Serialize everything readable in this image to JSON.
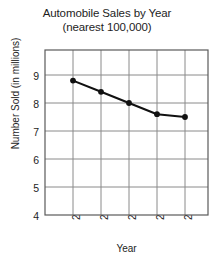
{
  "chart_data": {
    "type": "line",
    "title": "Automobile Sales by Year",
    "subtitle": "(nearest 100,000)",
    "xlabel": "Year",
    "ylabel": "Number Sold (in millions)",
    "categories": [
      "2006",
      "2007",
      "2008",
      "2009",
      "2010"
    ],
    "values": [
      8.8,
      8.4,
      8.0,
      7.6,
      7.5
    ],
    "series": [
      {
        "name": "Automobile Sales",
        "values": [
          8.8,
          8.4,
          8.0,
          7.6,
          7.5
        ]
      }
    ],
    "ylim": [
      4,
      9.9
    ],
    "yticks": [
      "9",
      "8",
      "7",
      "6",
      "5",
      "4"
    ],
    "ytick_values": [
      9,
      8,
      7,
      6,
      5,
      4
    ],
    "grid": true,
    "legend": false,
    "marker": "circle",
    "line_color": "#111111",
    "grid_color": "#8a8a8a",
    "frame_color": "#555555",
    "background": "#ffffff"
  }
}
